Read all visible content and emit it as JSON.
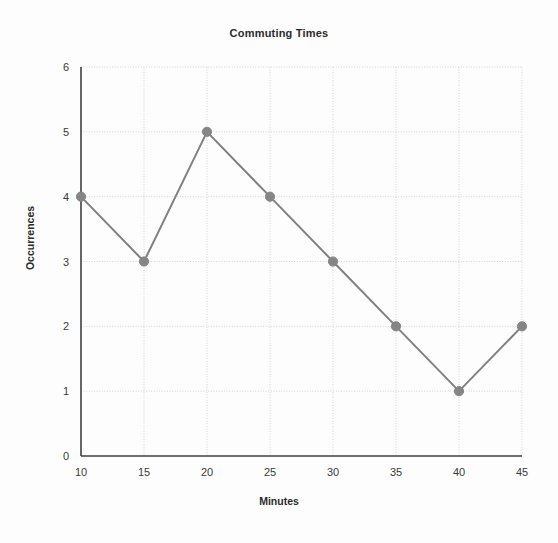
{
  "chart_data": {
    "type": "line",
    "title": "Commuting Times",
    "xlabel": "Minutes",
    "ylabel": "Occurrences",
    "x": [
      10,
      15,
      20,
      25,
      30,
      35,
      40,
      45
    ],
    "values": [
      4,
      3,
      5,
      4,
      3,
      2,
      1,
      2
    ],
    "xticks": [
      10,
      15,
      20,
      25,
      30,
      35,
      40,
      45
    ],
    "yticks": [
      0,
      1,
      2,
      3,
      4,
      5,
      6
    ],
    "xlim": [
      10,
      45
    ],
    "ylim": [
      0,
      6
    ],
    "grid": true,
    "legend": "none",
    "series_color": "#808080",
    "marker_color": "#858585",
    "grid_color": "#cccccc",
    "axis_color": "#404040",
    "background": "#fdfdfd"
  }
}
